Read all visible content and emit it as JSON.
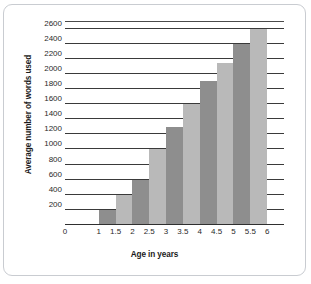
{
  "chart_data": {
    "type": "bar",
    "title": "",
    "xlabel": "Age in years",
    "ylabel": "Average number of words used",
    "categories": [
      "1.5",
      "2",
      "2.5",
      "3",
      "3.5",
      "4",
      "4.5",
      "5",
      "5.5",
      "6"
    ],
    "values": [
      200,
      400,
      600,
      1000,
      1300,
      1600,
      1900,
      2150,
      2400,
      2600
    ],
    "x_tick_labels": [
      "0",
      "1",
      "1.5",
      "2",
      "2.5",
      "3",
      "3.5",
      "4",
      "4.5",
      "5",
      "5.5",
      "6"
    ],
    "y_tick_labels": [
      "200",
      "400",
      "600",
      "800",
      "1000",
      "1200",
      "1400",
      "1600",
      "1800",
      "2000",
      "2200",
      "2400",
      "2600"
    ],
    "y_tick_values": [
      200,
      400,
      600,
      800,
      1000,
      1200,
      1400,
      1600,
      1800,
      2000,
      2200,
      2400,
      2600
    ],
    "ylim": [
      0,
      2700
    ],
    "xlim": [
      0,
      6.5
    ],
    "grid": true,
    "legend": false,
    "bar_colors": [
      "#8e8e8e",
      "#b9b9b9"
    ],
    "gridline_color": "#3a3a3a",
    "frame_color": "#c9ccd1"
  }
}
